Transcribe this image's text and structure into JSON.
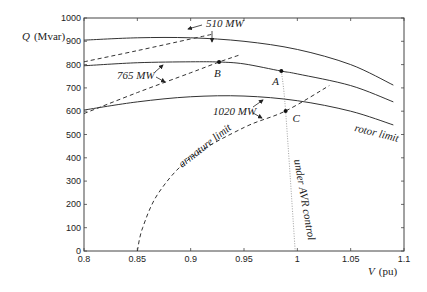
{
  "chart_data": {
    "type": "line",
    "title": "",
    "xlabel": "V (pu)",
    "ylabel": "Q (Mvar)",
    "xlim": [
      0.8,
      1.1
    ],
    "ylim": [
      0,
      1000
    ],
    "grid": false,
    "x_ticks": [
      "0.8",
      "0.85",
      "0.9",
      "0.95",
      "1",
      "1.05",
      "1.1"
    ],
    "y_ticks": [
      "0",
      "100",
      "200",
      "300",
      "400",
      "500",
      "600",
      "700",
      "800",
      "900",
      "1000"
    ],
    "series": [
      {
        "name": "rotor limit 510 MW",
        "style": "solid",
        "x": [
          0.8,
          0.85,
          0.9,
          0.95,
          1.0,
          1.05,
          1.09
        ],
        "y": [
          905,
          915,
          915,
          900,
          865,
          800,
          712
        ]
      },
      {
        "name": "rotor limit 765 MW",
        "style": "solid",
        "x": [
          0.8,
          0.85,
          0.9,
          0.9266,
          0.95,
          0.985,
          1.0,
          1.05,
          1.09
        ],
        "y": [
          795,
          808,
          812,
          811,
          803,
          772,
          760,
          710,
          640
        ]
      },
      {
        "name": "rotor limit 1020 MW",
        "style": "solid",
        "x": [
          0.8,
          0.85,
          0.9,
          0.95,
          1.0,
          1.05,
          1.09
        ],
        "y": [
          605,
          640,
          662,
          665,
          645,
          600,
          541
        ]
      },
      {
        "name": "armature limit 510 MW",
        "style": "dashed",
        "x": [
          0.8,
          0.85,
          0.9,
          0.92
        ],
        "y": [
          812,
          860,
          910,
          930
        ]
      },
      {
        "name": "armature limit 765 MW",
        "style": "dashed",
        "x": [
          0.8,
          0.85,
          0.9,
          0.9266,
          0.945
        ],
        "y": [
          590,
          680,
          765,
          811,
          840
        ]
      },
      {
        "name": "armature limit 1020 MW",
        "style": "dashed",
        "x": [
          0.85,
          0.855,
          0.87,
          0.9,
          0.95,
          0.989,
          1.03
        ],
        "y": [
          0,
          100,
          250,
          400,
          530,
          601,
          710
        ]
      },
      {
        "name": "under AVR control",
        "style": "dotted",
        "x": [
          0.985,
          0.989,
          0.998
        ],
        "y": [
          772,
          601,
          0
        ]
      }
    ],
    "points": [
      {
        "label": "A",
        "x": 0.985,
        "y": 772
      },
      {
        "label": "B",
        "x": 0.9266,
        "y": 811
      },
      {
        "label": "C",
        "x": 0.989,
        "y": 601
      }
    ],
    "annotations": [
      "510 MW",
      "765 MW",
      "1020 MW",
      "armature limit",
      "rotor limit",
      "under AVR control"
    ]
  },
  "labels": {
    "ylabel_q": "Q",
    "ylabel_unit": "(Mvar)",
    "xlabel_v": "V",
    "xlabel_unit": "(pu)",
    "mw510": "510 MW",
    "mw765": "765 MW",
    "mw1020": "1020 MW",
    "armature": "armature limit",
    "rotor": "rotor limit",
    "avr": "under AVR control",
    "pA": "A",
    "pB": "B",
    "pC": "C"
  },
  "colors": {
    "line": "#333333",
    "axis": "#444444"
  }
}
